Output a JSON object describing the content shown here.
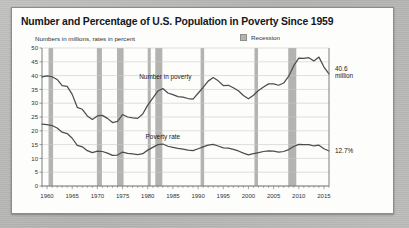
{
  "card": {
    "title": "Number and Percentage of U.S. Population in Poverty Since 1959",
    "subtitle": "Numbers in millions, rates in percent"
  },
  "legend": {
    "recession_label": "Recession",
    "recession_color": "#b3b3b1"
  },
  "annotations": {
    "number_value": "40.6",
    "number_unit": "million",
    "rate_value": "12.7%"
  },
  "chart_data": {
    "type": "line",
    "title": "Number and Percentage of U.S. Population in Poverty Since 1959",
    "subtitle": "Numbers in millions, rates in percent",
    "xlabel": "",
    "ylabel": "",
    "xlim": [
      1959,
      2016
    ],
    "ylim": [
      0,
      50
    ],
    "grid": true,
    "legend_position": "top-right",
    "yticks": [
      0,
      5,
      10,
      15,
      20,
      25,
      30,
      35,
      40,
      45,
      50
    ],
    "xticks": [
      1960,
      1965,
      1970,
      1975,
      1980,
      1985,
      1990,
      1995,
      2000,
      2005,
      2010,
      2015
    ],
    "x": [
      1959,
      1960,
      1961,
      1962,
      1963,
      1964,
      1965,
      1966,
      1967,
      1968,
      1969,
      1970,
      1971,
      1972,
      1973,
      1974,
      1975,
      1976,
      1977,
      1978,
      1979,
      1980,
      1981,
      1982,
      1983,
      1984,
      1985,
      1986,
      1987,
      1988,
      1989,
      1990,
      1991,
      1992,
      1993,
      1994,
      1995,
      1996,
      1997,
      1998,
      1999,
      2000,
      2001,
      2002,
      2003,
      2004,
      2005,
      2006,
      2007,
      2008,
      2009,
      2010,
      2011,
      2012,
      2013,
      2014,
      2015,
      2016
    ],
    "series": [
      {
        "name": "Number in poverty",
        "units": "millions",
        "color": "#4a4d51",
        "inline_label": "Number in poverty",
        "end_label": "40.6 million",
        "values": [
          39.5,
          39.9,
          39.6,
          38.6,
          36.4,
          36.1,
          33.2,
          28.5,
          27.8,
          25.4,
          24.1,
          25.4,
          25.6,
          24.5,
          23.0,
          23.4,
          25.9,
          25.0,
          24.7,
          24.5,
          26.1,
          29.3,
          31.8,
          34.4,
          35.3,
          33.7,
          33.1,
          32.4,
          32.2,
          31.7,
          31.5,
          33.6,
          35.7,
          38.0,
          39.3,
          38.1,
          36.4,
          36.5,
          35.6,
          34.5,
          32.8,
          31.6,
          32.9,
          34.6,
          35.9,
          37.0,
          37.0,
          36.5,
          37.3,
          39.8,
          43.6,
          46.3,
          46.2,
          46.5,
          45.3,
          46.7,
          43.1,
          40.6
        ]
      },
      {
        "name": "Poverty rate",
        "units": "percent",
        "color": "#4a4d51",
        "inline_label": "Poverty rate",
        "end_label": "12.7%",
        "values": [
          22.4,
          22.2,
          21.9,
          21.0,
          19.5,
          19.0,
          17.3,
          14.7,
          14.2,
          12.8,
          12.1,
          12.6,
          12.5,
          11.9,
          11.1,
          11.2,
          12.3,
          11.8,
          11.6,
          11.4,
          11.7,
          13.0,
          14.0,
          15.0,
          15.2,
          14.4,
          14.0,
          13.6,
          13.4,
          13.0,
          12.8,
          13.5,
          14.2,
          14.8,
          15.1,
          14.5,
          13.8,
          13.7,
          13.3,
          12.7,
          11.9,
          11.3,
          11.7,
          12.1,
          12.5,
          12.7,
          12.6,
          12.3,
          12.5,
          13.2,
          14.3,
          15.1,
          15.0,
          15.0,
          14.5,
          14.8,
          13.5,
          12.7
        ]
      }
    ],
    "recessions": [
      {
        "start": 1960.3,
        "end": 1961.2
      },
      {
        "start": 1969.9,
        "end": 1970.9
      },
      {
        "start": 1973.9,
        "end": 1975.2
      },
      {
        "start": 1980.0,
        "end": 1980.6
      },
      {
        "start": 1981.5,
        "end": 1982.9
      },
      {
        "start": 1990.5,
        "end": 1991.2
      },
      {
        "start": 2001.2,
        "end": 2001.9
      },
      {
        "start": 2007.9,
        "end": 2009.5
      }
    ]
  }
}
